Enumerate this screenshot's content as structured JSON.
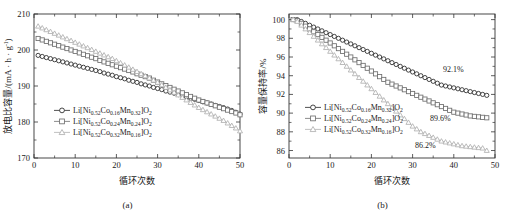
{
  "figure": {
    "background_color": "#ffffff",
    "panels": [
      {
        "id": "a",
        "caption": "(a)",
        "xlabel": "循环次数",
        "ylabel_main": "放电比容量/(mA",
        "ylabel_mid": "h",
        "ylabel_unit": "g",
        "ylabel_exp": "-1",
        "ylabel_close": ")"
      },
      {
        "id": "b",
        "caption": "(b)",
        "xlabel": "循环次数",
        "ylabel": "容量保持率/%"
      }
    ]
  },
  "legend": {
    "entries": [
      {
        "prefix": "Li[Ni",
        "ni": "0.52",
        "co_el": "Co",
        "co": "0.16",
        "mn_el": "Mn",
        "mn": "0.32",
        "suffix": "]O",
        "o2": "2",
        "marker": "circle",
        "color": "#262626"
      },
      {
        "prefix": "Li[Ni",
        "ni": "0.52",
        "co_el": "Co",
        "co": "0.24",
        "mn_el": "Mn",
        "mn": "0.24",
        "suffix": "]O",
        "o2": "2",
        "marker": "square",
        "color": "#6e6e6e"
      },
      {
        "prefix": "Li[Ni",
        "ni": "0.52",
        "co_el": "Co",
        "co": "0.32",
        "mn_el": "Mn",
        "mn": "0.16",
        "suffix": "]O",
        "o2": "2",
        "marker": "triangle",
        "color": "#b0b0b0"
      }
    ]
  },
  "annotations": {
    "retention_circle": "92.1%",
    "retention_square": "89.6%",
    "retention_triangle": "86.2%"
  },
  "chart_data": [
    {
      "type": "line",
      "panel": "a",
      "title": "",
      "xlabel": "循环次数",
      "ylabel": "放电比容量/(mA·h·g⁻¹)",
      "xlim": [
        0,
        50
      ],
      "ylim": [
        170,
        210
      ],
      "xticks": [
        0,
        10,
        20,
        30,
        40,
        50
      ],
      "yticks": [
        170,
        180,
        190,
        200,
        210
      ],
      "grid": false,
      "legend_position": "center-left",
      "x": [
        1,
        2,
        3,
        4,
        5,
        6,
        7,
        8,
        9,
        10,
        11,
        12,
        13,
        14,
        15,
        16,
        17,
        18,
        19,
        20,
        21,
        22,
        23,
        24,
        25,
        26,
        27,
        28,
        29,
        30,
        31,
        32,
        33,
        34,
        35,
        36,
        37,
        38,
        39,
        40,
        41,
        42,
        43,
        44,
        45,
        46,
        47,
        48,
        49,
        50
      ],
      "series": [
        {
          "name": "Li[Ni0.52Co0.16Mn0.32]O2",
          "marker": "circle",
          "color": "#262626",
          "values": [
            198.5,
            198.2,
            197.9,
            197.6,
            197.3,
            197.0,
            196.7,
            196.4,
            196.1,
            195.8,
            195.5,
            195.2,
            194.9,
            194.6,
            194.3,
            194.0,
            193.6,
            193.3,
            193.0,
            192.6,
            192.3,
            192.0,
            191.6,
            191.3,
            191.0,
            190.6,
            190.3,
            190.0,
            189.6,
            189.3,
            189.0,
            188.6,
            188.3,
            188.0,
            187.6,
            187.3,
            187.0,
            186.6,
            186.3,
            186.0,
            185.6,
            185.3,
            185.0,
            184.6,
            184.3,
            184.0,
            183.6,
            183.2,
            182.7,
            182.2
          ]
        },
        {
          "name": "Li[Ni0.52Co0.24Mn0.24]O2",
          "marker": "square",
          "color": "#6e6e6e",
          "values": [
            203.2,
            202.8,
            202.4,
            202.0,
            201.6,
            201.2,
            200.8,
            200.4,
            200.0,
            199.6,
            199.2,
            198.8,
            198.4,
            198.0,
            197.6,
            197.1,
            196.7,
            196.3,
            195.9,
            195.5,
            195.1,
            194.7,
            194.3,
            193.9,
            193.4,
            193.0,
            192.6,
            192.2,
            191.6,
            191.1,
            190.6,
            190.1,
            189.6,
            189.1,
            188.6,
            188.1,
            187.6,
            187.1,
            186.6,
            186.1,
            185.7,
            185.3,
            184.9,
            184.5,
            184.1,
            183.7,
            183.3,
            182.9,
            182.5,
            182.0
          ]
        },
        {
          "name": "Li[Ni0.52Co0.32Mn0.16]O2",
          "marker": "triangle",
          "color": "#b0b0b0",
          "values": [
            206.6,
            206.1,
            205.6,
            205.1,
            204.6,
            204.1,
            203.6,
            203.1,
            202.6,
            202.1,
            201.6,
            201.1,
            200.6,
            200.1,
            199.6,
            199.1,
            198.6,
            198.1,
            197.6,
            197.0,
            196.4,
            195.8,
            195.2,
            194.6,
            194.0,
            193.4,
            192.8,
            192.2,
            191.6,
            191.0,
            190.3,
            189.6,
            188.9,
            188.2,
            187.5,
            186.8,
            186.1,
            185.4,
            184.7,
            184.0,
            183.4,
            182.8,
            182.2,
            181.6,
            181.0,
            180.4,
            179.7,
            179.0,
            178.3,
            177.5
          ]
        }
      ]
    },
    {
      "type": "line",
      "panel": "b",
      "title": "",
      "xlabel": "循环次数",
      "ylabel": "容量保持率/%",
      "xlim": [
        0,
        50
      ],
      "ylim": [
        85.2,
        100.6
      ],
      "xticks": [
        0,
        10,
        20,
        30,
        40,
        50
      ],
      "yticks": [
        86,
        88,
        90,
        92,
        94,
        96,
        98,
        100
      ],
      "grid": false,
      "legend_position": "center-left",
      "x": [
        1,
        2,
        3,
        4,
        5,
        6,
        7,
        8,
        9,
        10,
        11,
        12,
        13,
        14,
        15,
        16,
        17,
        18,
        19,
        20,
        21,
        22,
        23,
        24,
        25,
        26,
        27,
        28,
        29,
        30,
        31,
        32,
        33,
        34,
        35,
        36,
        37,
        38,
        39,
        40,
        41,
        42,
        43,
        44,
        45,
        46,
        47,
        48
      ],
      "series": [
        {
          "name": "Li[Ni0.52Co0.16Mn0.32]O2",
          "marker": "circle",
          "color": "#262626",
          "end_label": "92.1%",
          "values": [
            100.0,
            100.0,
            99.8,
            99.6,
            99.4,
            99.2,
            99.0,
            98.8,
            98.6,
            98.4,
            98.2,
            98.0,
            97.8,
            97.6,
            97.4,
            97.2,
            97.0,
            96.8,
            96.6,
            96.4,
            96.2,
            96.0,
            95.8,
            95.6,
            95.4,
            95.2,
            95.0,
            94.8,
            94.6,
            94.4,
            94.2,
            94.0,
            93.8,
            93.6,
            93.4,
            93.2,
            93.0,
            92.9,
            92.8,
            92.7,
            92.6,
            92.5,
            92.4,
            92.3,
            92.2,
            92.1,
            92.0,
            91.9
          ]
        },
        {
          "name": "Li[Ni0.52Co0.24Mn0.24]O2",
          "marker": "square",
          "color": "#6e6e6e",
          "end_label": "89.6%",
          "values": [
            100.0,
            99.9,
            99.6,
            99.3,
            99.0,
            98.7,
            98.4,
            98.1,
            97.8,
            97.5,
            97.2,
            96.9,
            96.6,
            96.3,
            96.0,
            95.7,
            95.4,
            95.1,
            94.8,
            94.5,
            94.2,
            93.9,
            93.6,
            93.3,
            93.1,
            92.9,
            92.7,
            92.5,
            92.3,
            92.1,
            91.9,
            91.7,
            91.5,
            91.3,
            91.1,
            90.9,
            90.7,
            90.5,
            90.3,
            90.1,
            90.0,
            89.9,
            89.8,
            89.7,
            89.65,
            89.6,
            89.55,
            89.5
          ]
        },
        {
          "name": "Li[Ni0.52Co0.32Mn0.16]O2",
          "marker": "triangle",
          "color": "#b0b0b0",
          "end_label": "86.2%",
          "values": [
            100.0,
            99.8,
            99.4,
            99.0,
            98.6,
            98.2,
            97.8,
            97.4,
            97.0,
            96.6,
            96.2,
            95.8,
            95.4,
            95.0,
            94.6,
            94.2,
            93.8,
            93.4,
            93.0,
            92.6,
            92.2,
            91.8,
            91.4,
            91.0,
            90.6,
            90.2,
            89.8,
            89.4,
            89.0,
            88.6,
            88.3,
            88.0,
            87.8,
            87.6,
            87.4,
            87.2,
            87.0,
            86.9,
            86.8,
            86.7,
            86.6,
            86.5,
            86.45,
            86.4,
            86.35,
            86.3,
            86.25,
            86.0
          ]
        }
      ]
    }
  ]
}
